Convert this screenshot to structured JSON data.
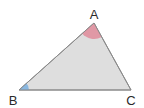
{
  "diagram": {
    "type": "triangle",
    "fill_color": "#dedede",
    "stroke_color": "#8a8a8a",
    "vertices": [
      {
        "label": "A",
        "x": 94,
        "y": 23
      },
      {
        "label": "B",
        "x": 19,
        "y": 90
      },
      {
        "label": "C",
        "x": 131,
        "y": 90
      }
    ],
    "angle_marks": [
      {
        "vertex": "A",
        "color": "#e0909f"
      },
      {
        "vertex": "B",
        "color": "#7fb3e0"
      }
    ]
  }
}
